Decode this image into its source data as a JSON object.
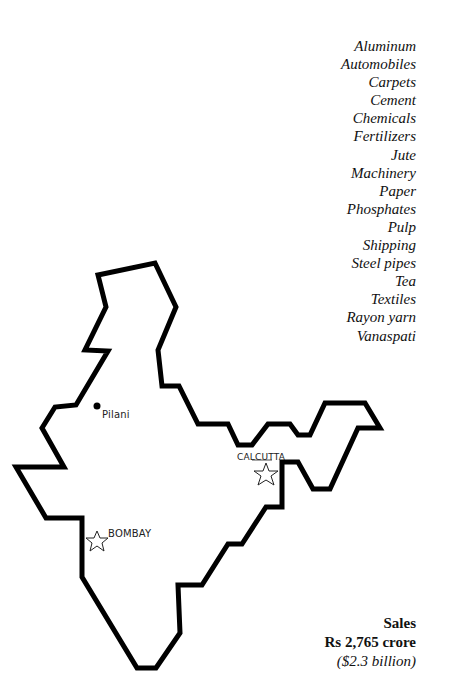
{
  "industries": [
    "Aluminum",
    "Automobiles",
    "Carpets",
    "Cement",
    "Chemicals",
    "Fertilizers",
    "Jute",
    "Machinery",
    "Paper",
    "Phosphates",
    "Pulp",
    "Shipping",
    "Steel pipes",
    "Tea",
    "Textiles",
    "Rayon yarn",
    "Vanaspati"
  ],
  "map": {
    "region": "India",
    "cities": [
      {
        "name": "Pilani",
        "marker": "dot-icon"
      },
      {
        "name": "CALCUTTA",
        "marker": "star-icon"
      },
      {
        "name": "BOMBAY",
        "marker": "star-icon"
      }
    ]
  },
  "sales": {
    "label": "Sales",
    "value": "Rs 2,765 crore",
    "usd": "($2.3 billion)"
  }
}
